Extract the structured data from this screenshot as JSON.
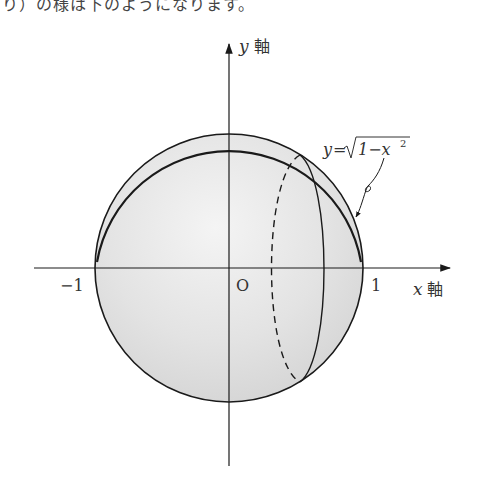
{
  "caption": {
    "partial_text": "り）の様は下のようになります。"
  },
  "diagram": {
    "axes": {
      "x_axis_label_var": "x",
      "x_axis_label_kanji": "軸",
      "y_axis_label_var": "y",
      "y_axis_label_kanji": "軸"
    },
    "tick_labels": {
      "neg_one": "−1",
      "origin": "O",
      "pos_one": "1"
    },
    "curve_label": {
      "lhs": "y",
      "eq": "=",
      "sqrt_body": "1−x",
      "exponent": "2"
    },
    "colors": {
      "outline": "#1a1a1a",
      "fill_light": "#f2f2f2",
      "fill_mid": "#e2e2e2",
      "fill_dark": "#d2d2d2"
    },
    "geometry": {
      "center_x": 229,
      "center_y": 268,
      "radius": 134,
      "section_center_x": 296,
      "section_rx": 29,
      "section_ry": 113
    }
  }
}
